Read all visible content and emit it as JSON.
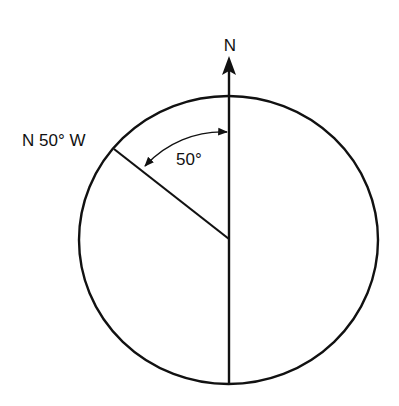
{
  "diagram": {
    "north_label": "N",
    "bearing_label": "N 50° W",
    "angle_label": "50°",
    "angle_degrees": 50,
    "colors": {
      "stroke": "#111111",
      "background": "#ffffff"
    }
  }
}
